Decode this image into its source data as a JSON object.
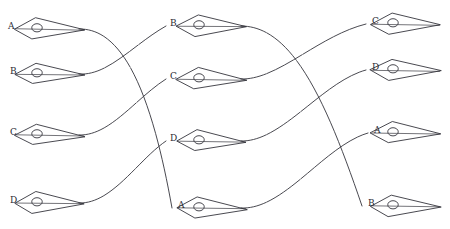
{
  "diagram": {
    "style": {
      "background": "#ffffff",
      "ink": "#34343c",
      "stroke_width": 0.9,
      "label_color": "#2b2b33",
      "glyph_fill": "none"
    },
    "columns": [
      {
        "name": "left-column",
        "x": 44,
        "nodes": [
          {
            "label": "A",
            "y": 29,
            "label_x": 8,
            "label_y": 22,
            "tip_x": 79
          },
          {
            "label": "B",
            "y": 74,
            "label_x": 10,
            "label_y": 67,
            "tip_x": 79
          },
          {
            "label": "C",
            "y": 135,
            "label_x": 10,
            "label_y": 128,
            "tip_x": 79
          },
          {
            "label": "D",
            "y": 203,
            "label_x": 10,
            "label_y": 196,
            "tip_x": 79
          }
        ]
      },
      {
        "name": "middle-column",
        "x": 206,
        "nodes": [
          {
            "label": "B",
            "y": 26,
            "label_x": 170,
            "label_y": 19,
            "tip_x": 241
          },
          {
            "label": "C",
            "y": 79,
            "label_x": 170,
            "label_y": 72,
            "tip_x": 241
          },
          {
            "label": "D",
            "y": 141,
            "label_x": 170,
            "label_y": 134,
            "tip_x": 241
          },
          {
            "label": "A",
            "y": 208,
            "label_x": 178,
            "label_y": 201,
            "tip_x": 241
          }
        ]
      },
      {
        "name": "right-column",
        "x": 400,
        "nodes": [
          {
            "label": "C",
            "y": 24,
            "label_x": 372,
            "label_y": 17,
            "tip_x": 436
          },
          {
            "label": "D",
            "y": 70,
            "label_x": 372,
            "label_y": 63,
            "tip_x": 436
          },
          {
            "label": "A",
            "y": 133,
            "label_x": 374,
            "label_y": 126,
            "tip_x": 436
          },
          {
            "label": "B",
            "y": 206,
            "label_x": 368,
            "label_y": 199,
            "tip_x": 436
          }
        ]
      }
    ],
    "glyph": {
      "name": "dart-eye-glyph",
      "description": "elongated kite / dart outline with a small circle near the blunt end",
      "half_height": 11,
      "length": 70,
      "circle_radius": 5
    },
    "edges": [
      {
        "id": "e1",
        "from": "left-A",
        "to": "middle-A",
        "from_x": 79,
        "from_y": 29,
        "to_x": 172,
        "to_y": 208,
        "c1x": 124,
        "c1y": 28,
        "c2x": 152,
        "c2y": 96
      },
      {
        "id": "e2",
        "from": "left-B",
        "to": "middle-B",
        "from_x": 79,
        "from_y": 74,
        "to_x": 166,
        "to_y": 26,
        "c1x": 108,
        "c1y": 76,
        "c2x": 134,
        "c2y": 44
      },
      {
        "id": "e3",
        "from": "left-C",
        "to": "middle-C",
        "from_x": 79,
        "from_y": 135,
        "to_x": 166,
        "to_y": 79,
        "c1x": 110,
        "c1y": 136,
        "c2x": 136,
        "c2y": 98
      },
      {
        "id": "e4",
        "from": "left-D",
        "to": "middle-D",
        "from_x": 79,
        "from_y": 203,
        "to_x": 166,
        "to_y": 141,
        "c1x": 112,
        "c1y": 204,
        "c2x": 138,
        "c2y": 160
      },
      {
        "id": "e5",
        "from": "middle-B",
        "to": "right-B",
        "from_x": 241,
        "from_y": 26,
        "to_x": 362,
        "to_y": 206,
        "c1x": 292,
        "c1y": 26,
        "c2x": 326,
        "c2y": 100
      },
      {
        "id": "e6",
        "from": "middle-C",
        "to": "right-C",
        "from_x": 241,
        "from_y": 79,
        "to_x": 366,
        "to_y": 24,
        "c1x": 278,
        "c1y": 80,
        "c2x": 318,
        "c2y": 36
      },
      {
        "id": "e7",
        "from": "middle-D",
        "to": "right-D",
        "from_x": 241,
        "from_y": 141,
        "to_x": 366,
        "to_y": 70,
        "c1x": 282,
        "c1y": 142,
        "c2x": 322,
        "c2y": 82
      },
      {
        "id": "e8",
        "from": "middle-A",
        "to": "right-A",
        "from_x": 241,
        "from_y": 208,
        "to_x": 368,
        "to_y": 133,
        "c1x": 284,
        "c1y": 210,
        "c2x": 324,
        "c2y": 146
      }
    ]
  }
}
